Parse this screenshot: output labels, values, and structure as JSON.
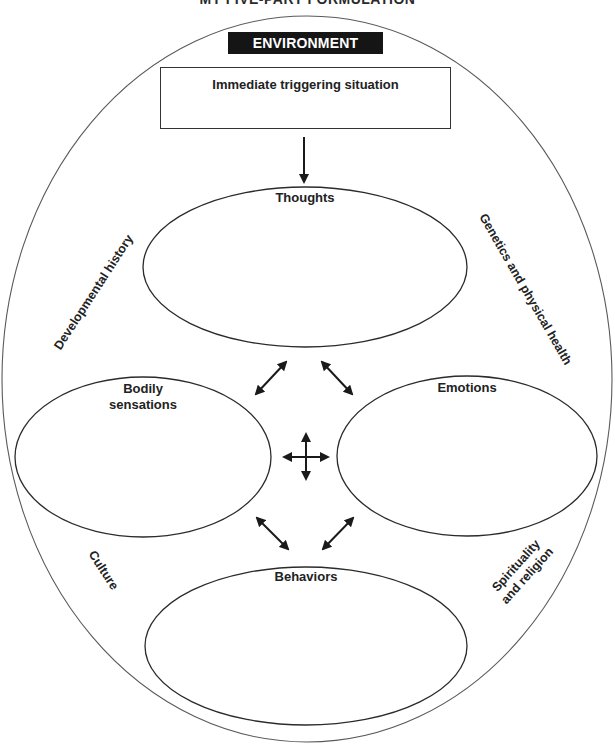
{
  "title_partial": "MY FIVE-PART FORMULATION",
  "environment": {
    "label": "ENVIRONMENT"
  },
  "trigger": {
    "label": "Immediate triggering situation"
  },
  "nodes": {
    "thoughts": "Thoughts",
    "bodily_line1": "Bodily",
    "bodily_line2": "sensations",
    "emotions": "Emotions",
    "behaviors": "Behaviors"
  },
  "context_factors": {
    "developmental": "Developmental history",
    "genetics": "Genetics and physical health",
    "culture": "Culture",
    "spirituality_line1": "Spirituality",
    "spirituality_line2": "and religion"
  },
  "colors": {
    "line": "#2b2b2b",
    "outer_line": "#555555",
    "env_bg": "#151515",
    "env_text": "#ffffff",
    "arrow": "#1a1a1a"
  }
}
